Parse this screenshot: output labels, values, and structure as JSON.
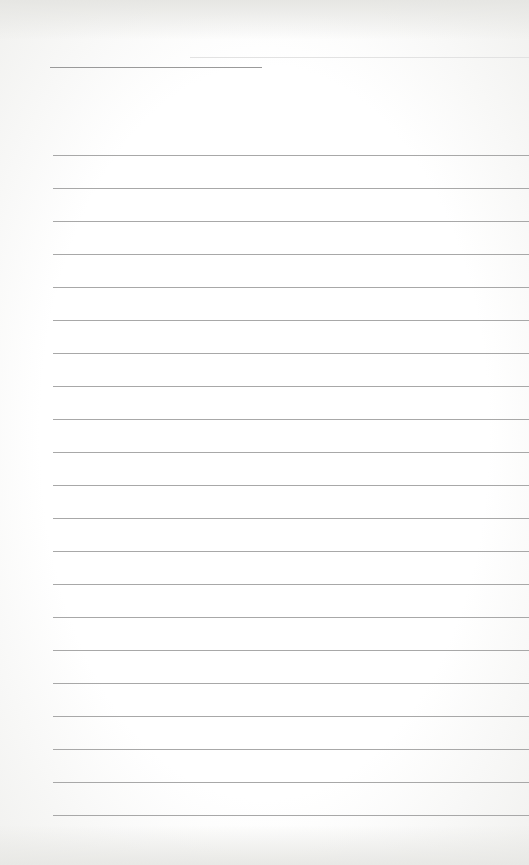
{
  "page": {
    "type": "lined-paper",
    "header_line": {
      "x": 50,
      "y": 67,
      "width": 212
    },
    "faint_line": {
      "x": 190,
      "y": 57
    },
    "rules": {
      "count": 21,
      "start_y": 155,
      "spacing": 33,
      "left": 53
    },
    "colors": {
      "background": "#ffffff",
      "rule": "#a8a8a8"
    }
  }
}
